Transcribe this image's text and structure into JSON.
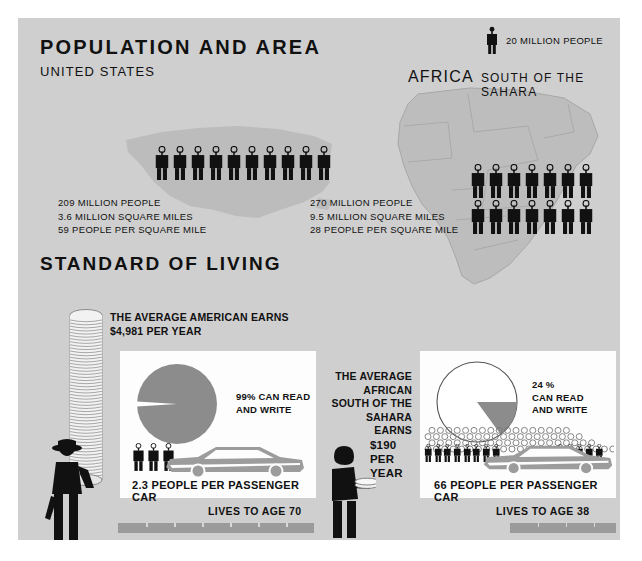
{
  "poster": {
    "background_color": "#cfcfcf",
    "panel_color": "#fdfdfd",
    "accent_gray": "#8c8c8c",
    "figure_color": "#111111"
  },
  "section_population": {
    "title": "POPULATION AND AREA",
    "subtitle_us": "UNITED STATES",
    "africa_title": "AFRICA",
    "africa_subtitle": "SOUTH OF THE SAHARA",
    "legend": {
      "icon": "person-icon",
      "label": "20 MILLION PEOPLE",
      "unit_value": 20
    },
    "united_states": {
      "population": "209 MILLION PEOPLE",
      "area": "3.6 MILLION SQUARE MILES",
      "density": "59 PEOPLE PER SQUARE MILE",
      "figure_count": 10
    },
    "africa": {
      "population": "270 MILLION PEOPLE",
      "area": "9.5 MILLION SQUARE MILES",
      "density": "28 PEOPLE PER SQUARE MILE",
      "figure_count_row1": 7,
      "figure_count_row2": 7
    }
  },
  "section_standard_of_living": {
    "title": "STANDARD OF LIVING",
    "united_states": {
      "earnings_line1": "THE AVERAGE AMERICAN EARNS",
      "earnings_line2": "$4,981 PER YEAR",
      "literacy_line1": "99% CAN READ",
      "literacy_line2": "AND WRITE",
      "literacy_percent": 99,
      "car_caption": "2.3 PEOPLE PER PASSENGER CAR",
      "people_per_car": 2.3,
      "life_caption": "LIVES TO AGE 70",
      "life_age": 70
    },
    "africa": {
      "earnings_line1": "THE AVERAGE",
      "earnings_line2": "AFRICAN",
      "earnings_line3": "SOUTH OF THE",
      "earnings_line4": "SAHARA EARNS",
      "amount_line1": "$190",
      "amount_line2": "PER",
      "amount_line3": "YEAR",
      "literacy_line1": "24 %",
      "literacy_line2": "CAN READ",
      "literacy_line3": "AND WRITE",
      "literacy_percent": 24,
      "car_caption": "66 PEOPLE PER PASSENGER CAR",
      "people_per_car": 66,
      "life_caption": "LIVES TO AGE 38",
      "life_age": 38
    }
  },
  "chart_data": [
    {
      "type": "pie",
      "title": "99% CAN READ AND WRITE",
      "labels": [
        "Can read and write",
        "Cannot read and write"
      ],
      "values": [
        99,
        1
      ],
      "colors": [
        "#8c8c8c",
        "#ffffff"
      ],
      "region": "United States"
    },
    {
      "type": "pie",
      "title": "24 % CAN READ AND WRITE",
      "labels": [
        "Can read and write",
        "Cannot read and write"
      ],
      "values": [
        24,
        76
      ],
      "colors": [
        "#8c8c8c",
        "#ffffff"
      ],
      "region": "Africa South of the Sahara"
    },
    {
      "type": "bar",
      "title": "Life expectancy",
      "categories": [
        "United States",
        "Africa South of the Sahara"
      ],
      "values": [
        70,
        38
      ],
      "ylabel": "Years",
      "ylim": [
        0,
        70
      ]
    },
    {
      "type": "bar",
      "title": "Population (millions)",
      "categories": [
        "United States",
        "Africa South of the Sahara"
      ],
      "values": [
        209,
        270
      ],
      "ylabel": "Millions of people",
      "ylim": [
        0,
        300
      ]
    }
  ]
}
